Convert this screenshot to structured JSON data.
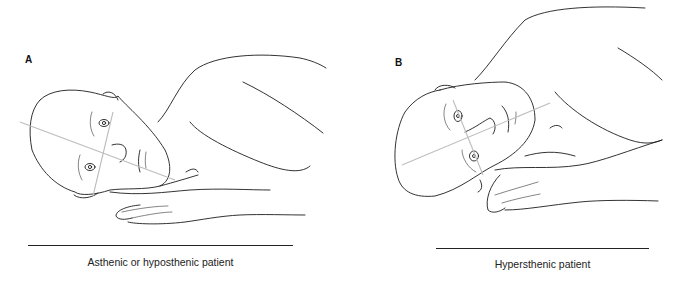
{
  "figure": {
    "panels": [
      {
        "label": "A",
        "caption": "Asthenic or hyposthenic patient"
      },
      {
        "label": "B",
        "caption": "Hypersthenic patient"
      }
    ],
    "colors": {
      "ink": "#1c1c1c",
      "guide_line": "#bdbdbd",
      "background": "#ffffff"
    }
  }
}
